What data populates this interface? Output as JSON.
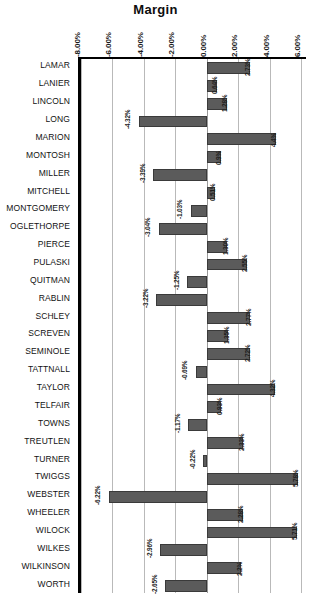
{
  "chart_data": {
    "type": "bar",
    "orientation": "horizontal",
    "title": "Margin",
    "xlabel": "",
    "ylabel": "",
    "xlim": [
      -8.0,
      6.5
    ],
    "grid": true,
    "legend": false,
    "value_suffix": "%",
    "xticks": [
      -8.0,
      -6.0,
      -4.0,
      -2.0,
      0.0,
      2.0,
      4.0,
      6.0
    ],
    "xtick_labels": [
      "-8.00%",
      "-6.00%",
      "-4.00%",
      "-2.00%",
      "0.00%",
      "2.00%",
      "4.00%",
      "6.00%"
    ],
    "categories": [
      "LAMAR",
      "LANIER",
      "LINCOLN",
      "LONG",
      "MARION",
      "MONTOSH",
      "MILLER",
      "MITCHELL",
      "MONTGOMERY",
      "OGLETHORPE",
      "PIERCE",
      "PULASKI",
      "QUITMAN",
      "RABLIN",
      "SCHLEY",
      "SCREVEN",
      "SEMINOLE",
      "TATTNALL",
      "TAYLOR",
      "TELFAIR",
      "TOWNS",
      "TREUTLEN",
      "TURNER",
      "TWIGGS",
      "WEBSTER",
      "WHEELER",
      "WILOCK",
      "WILKES",
      "WILKINSON",
      "WORTH"
    ],
    "values": [
      2.73,
      0.64,
      1.28,
      -4.32,
      4.4,
      0.9,
      -3.39,
      0.51,
      -1.03,
      -3.04,
      1.3,
      2.55,
      -1.25,
      -3.22,
      2.77,
      1.35,
      2.72,
      -0.69,
      4.32,
      0.93,
      -1.17,
      2.33,
      -0.22,
      5.78,
      -6.22,
      2.28,
      5.71,
      -2.96,
      2.2,
      -2.65
    ],
    "value_labels": [
      "2.73%",
      "0.64%",
      "1.28%",
      "-4.32%",
      "4.4%",
      "0.9%",
      "-3.39%",
      "0.51%",
      "-1.03%",
      "-3.04%",
      "1.30%",
      "2.55%",
      "-1.25%",
      "-3.22%",
      "2.77%",
      "1.35%",
      "2.72%",
      "-0.69%",
      "4.32%",
      "0.93%",
      "-1.17%",
      "2.33%",
      "-0.22%",
      "5.78%",
      "-6.22%",
      "2.28%",
      "5.71%",
      "-2.96%",
      "2.2%",
      "-2.65%"
    ],
    "colors": {
      "bar_fill": "#5b5b5b",
      "bar_stroke": "#3a3a3a",
      "gridline": "#b9b9b9",
      "axis": "#000000",
      "text": "#111111",
      "background": "#ffffff"
    }
  }
}
